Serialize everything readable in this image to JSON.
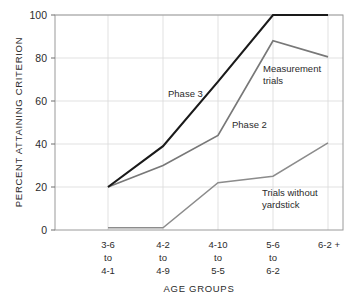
{
  "chart_data": {
    "type": "line",
    "title": "",
    "xlabel": "AGE  GROUPS",
    "ylabel": "PERCENT ATTAINING CRITERION",
    "ylim": [
      0,
      100
    ],
    "yticks": [
      0,
      20,
      40,
      60,
      80,
      100
    ],
    "ytick_labels": [
      "0",
      "20",
      "40",
      "60",
      "80",
      "100"
    ],
    "grid": true,
    "legend_position": "inline-annotations",
    "categories": [
      "3-6\nto\n4-1",
      "4-2\nto\n4-9",
      "4-10\nto\n5-5",
      "5-6\nto\n6-2",
      "6-2 +"
    ],
    "category_lines": [
      [
        "3-6",
        "to",
        "4-1"
      ],
      [
        "4-2",
        "to",
        "4-9"
      ],
      [
        "4-10",
        "to",
        "5-5"
      ],
      [
        "5-6",
        "to",
        "6-2"
      ],
      [
        "6-2 +",
        "",
        ""
      ]
    ],
    "series": [
      {
        "name": "Phase 3",
        "color": "#1a1a1a",
        "width": 2.1,
        "values": [
          20,
          39,
          69,
          100,
          100
        ]
      },
      {
        "name": "Phase 2",
        "color": "#787878",
        "width": 1.7,
        "values": [
          20,
          30,
          44,
          88,
          80.5
        ]
      },
      {
        "name": "Trials without yardstick",
        "color": "#8c8c8c",
        "width": 1.5,
        "values": [
          1,
          1,
          22,
          25,
          40.5
        ]
      }
    ],
    "annotations": [
      {
        "id": "phase-3-label",
        "text": "Phase 3",
        "x": 168,
        "y": 97
      },
      {
        "id": "phase-2-label",
        "text": "Phase 2",
        "x": 232,
        "y": 128
      },
      {
        "id": "measurement-trials-label-line1",
        "text": "Measurement",
        "x": 263,
        "y": 72
      },
      {
        "id": "measurement-trials-label-line2",
        "text": "trials",
        "x": 263,
        "y": 84
      },
      {
        "id": "trials-without-yardstick-label-line1",
        "text": "Trials  without",
        "x": 262,
        "y": 196
      },
      {
        "id": "trials-without-yardstick-label-line2",
        "text": "yardstick",
        "x": 262,
        "y": 208
      }
    ]
  }
}
